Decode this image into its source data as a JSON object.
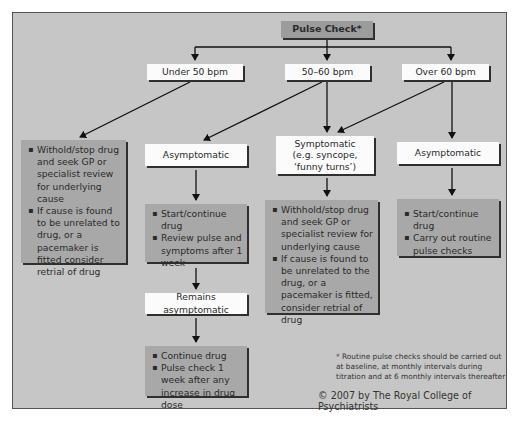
{
  "title": "Pulse Check*",
  "branches": [
    {
      "label": "Under 50 bpm"
    },
    {
      "label": "50–60 bpm"
    },
    {
      "label": "Over 60 bpm"
    }
  ],
  "under50": {
    "actions": [
      "Withold/stop drug and seek GP or specialist review for underlying cause",
      "If cause is found to be unrelated to drug, or a pacemaker is fitted consider retrial of drug"
    ]
  },
  "range50_60": {
    "asymptomatic_label": "Asymptomatic",
    "asymptomatic_actions": [
      "Start/continue drug",
      "Review pulse and symptoms after 1 week"
    ],
    "remains_label": "Remains asymptomatic",
    "remains_actions": [
      "Continue drug",
      "Pulse check 1 week after any increase in drug dose"
    ]
  },
  "symptomatic": {
    "label_line1": "Symptomatic",
    "label_line2": "(e.g. syncope,",
    "label_line3": "‘funny turns’)",
    "actions": [
      "Withhold/stop drug and seek GP or specialist review for underlying cause",
      "If cause is found to be unrelated to the drug, or a pacemaker is fitted, consider retrial of drug"
    ]
  },
  "over60": {
    "asymptomatic_label": "Asymptomatic",
    "actions": [
      "Start/continue drug",
      "Carry out routine pulse checks"
    ]
  },
  "footnote": "* Routine pulse checks should be carried out at baseline, at monthly intervals during titration and at 6 monthly intervals thereafter",
  "copyright": "© 2007 by The Royal College of Psychiatrists",
  "colors": {
    "background": "#c6c6c6",
    "action_box": "#a8a8a8",
    "label_box": "#fbfbfb",
    "title_box": "#9c9c9c"
  }
}
